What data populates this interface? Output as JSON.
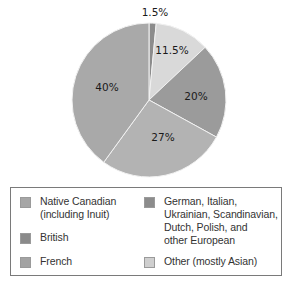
{
  "chart_data": {
    "type": "pie",
    "title": "",
    "start_angle": "12 o'clock, clockwise",
    "slices": [
      {
        "label": "Native Canadian (including Inuit)",
        "value": 1.5,
        "display": "1.5%",
        "color": "#8c8c8c"
      },
      {
        "label": "Other (mostly Asian)",
        "value": 11.5,
        "display": "11.5%",
        "color": "#d9d9d9"
      },
      {
        "label": "German, Italian, Ukrainian, Scandinavian, Dutch, Polish, and other European",
        "value": 20,
        "display": "20%",
        "color": "#9b9b9b"
      },
      {
        "label": "French",
        "value": 27,
        "display": "27%",
        "color": "#b3b3b3"
      },
      {
        "label": "British",
        "value": 40,
        "display": "40%",
        "color": "#a9a9a9"
      }
    ],
    "legend_position": "bottom"
  },
  "legend": {
    "items": [
      {
        "label": "Native Canadian\n(including Inuit)",
        "color": "#a6a6a6"
      },
      {
        "label": "British",
        "color": "#8a8a8a"
      },
      {
        "label": "French",
        "color": "#a3a3a3"
      },
      {
        "label": "German, Italian,\nUkrainian, Scandinavian,\nDutch, Polish, and\nother European",
        "color": "#8c8c8c"
      },
      {
        "label": "Other (mostly Asian)",
        "color": "#cfcfcf"
      }
    ]
  }
}
